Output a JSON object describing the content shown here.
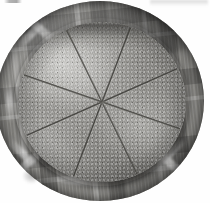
{
  "scene": {
    "subject": "round baked pie cut into eight wedges",
    "surface": "plaid tablecloth",
    "background_color": "#ffffff",
    "tone": "desaturated grayscale photograph",
    "caption": ""
  },
  "image": {
    "width": 210,
    "height": 203
  },
  "cloth": {
    "name": "plaid tablecloth",
    "base_color": "#8b8a86",
    "dark_band_color": "#3a3936",
    "light_stripe_color": "#e2e1dd",
    "center_x": 100,
    "center_y": 101,
    "radius_x": 104,
    "radius_y": 100
  },
  "rim": {
    "name": "dark crust rim",
    "color": "#2a2927",
    "center_x": 101,
    "center_y": 102,
    "radius_x": 87,
    "radius_y": 84
  },
  "pie": {
    "name": "pie top surface",
    "light_color": "#dcdbd7",
    "mid_color": "#94938f",
    "dark_color": "#5f5e5b",
    "center_x": 102,
    "center_y": 102,
    "radius_x": 84,
    "radius_y": 80,
    "slice_count": 8,
    "cut_color": "#2f2e2b",
    "cuts": [
      {
        "label": "cut-1",
        "angle_deg": 20
      },
      {
        "label": "cut-2",
        "angle_deg": 65
      },
      {
        "label": "cut-3",
        "angle_deg": 110
      },
      {
        "label": "cut-4",
        "angle_deg": 155
      },
      {
        "label": "cut-5",
        "angle_deg": 200
      },
      {
        "label": "cut-6",
        "angle_deg": 245
      },
      {
        "label": "cut-7",
        "angle_deg": 290
      },
      {
        "label": "cut-8",
        "angle_deg": 335
      }
    ]
  },
  "artifacts": {
    "top_left_smudge": "faint gray scan mark",
    "top_right_smudge": "faint gray scan mark",
    "lower_left_smudge": "faint gray scan mark"
  }
}
